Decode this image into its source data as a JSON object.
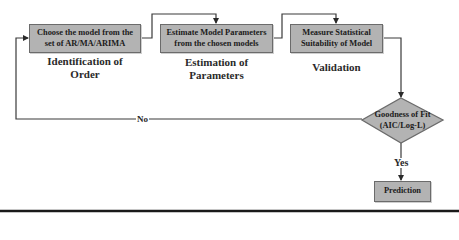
{
  "diagram": {
    "steps": [
      {
        "box_lines": [
          "Choose the model from the",
          "set of AR/MA/ARIMA"
        ],
        "caption_lines": [
          "Identification of",
          "Order"
        ]
      },
      {
        "box_lines": [
          "Estimate Model Parameters",
          "from the chosen models"
        ],
        "caption_lines": [
          "Estimation of",
          "Parameters"
        ]
      },
      {
        "box_lines": [
          "Measure Statistical",
          "Suitability of Model"
        ],
        "caption_lines": [
          "Validation"
        ]
      }
    ],
    "decision": {
      "lines": [
        "Goodness of Fit",
        "(AIC/Log-L)"
      ]
    },
    "edges": {
      "no_label": "No",
      "yes_label": "Yes"
    },
    "output": {
      "label": "Prediction"
    },
    "colors": {
      "box_fill": "#b3b3b3",
      "box_border": "#6b6b6b",
      "line": "#3a3a3a",
      "text": "#1b1b1b"
    }
  }
}
